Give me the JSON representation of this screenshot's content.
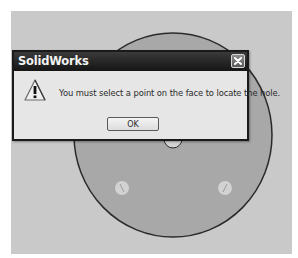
{
  "dialog": {
    "title": "SolidWorks",
    "message": "You must select a point on the face to locate the hole.",
    "ok_label": "OK",
    "icon": "warning-icon",
    "close_icon": "close-icon"
  },
  "viewport": {
    "background_color": "#c9c9c9",
    "part_face_color": "#a8a8a8",
    "part_outline_color": "#2a2a2a",
    "hole_color": "#d6d6d6"
  }
}
